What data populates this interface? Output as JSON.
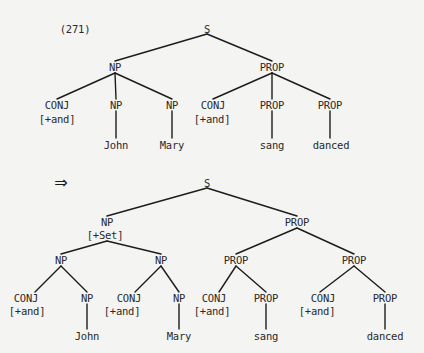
{
  "example_number": "(271)",
  "arrow": "⇒",
  "tree_before": {
    "nodes": [
      {
        "id": "S",
        "label": "S",
        "x": 207,
        "y": 29
      },
      {
        "id": "NP",
        "label": "NP",
        "x": 115,
        "y": 67
      },
      {
        "id": "PROP",
        "label": "PROP",
        "x": 272,
        "y": 67
      },
      {
        "id": "CONJ1",
        "label": "CONJ",
        "x": 57,
        "y": 105
      },
      {
        "id": "CONJ1f",
        "label": "[+and]",
        "x": 57,
        "y": 119
      },
      {
        "id": "NP1",
        "label": "NP",
        "x": 116,
        "y": 105
      },
      {
        "id": "NP2",
        "label": "NP",
        "x": 172,
        "y": 105
      },
      {
        "id": "CONJ2",
        "label": "CONJ",
        "x": 213,
        "y": 105
      },
      {
        "id": "CONJ2f",
        "label": "[+and]",
        "x": 212,
        "y": 119
      },
      {
        "id": "PROP1",
        "label": "PROP",
        "x": 272,
        "y": 105
      },
      {
        "id": "PROP2",
        "label": "PROP",
        "x": 330,
        "y": 105
      },
      {
        "id": "John",
        "label": "John",
        "x": 116,
        "y": 145
      },
      {
        "id": "Mary",
        "label": "Mary",
        "x": 172,
        "y": 145
      },
      {
        "id": "sang",
        "label": "sang",
        "x": 272,
        "y": 145
      },
      {
        "id": "danced",
        "label": "danced",
        "x": 331,
        "y": 145
      }
    ],
    "edges": [
      [
        207,
        34,
        115,
        61
      ],
      [
        207,
        34,
        272,
        61
      ],
      [
        115,
        73,
        57,
        99
      ],
      [
        115,
        73,
        116,
        99
      ],
      [
        115,
        73,
        172,
        99
      ],
      [
        272,
        73,
        213,
        99
      ],
      [
        272,
        73,
        272,
        99
      ],
      [
        272,
        73,
        330,
        99
      ],
      [
        116,
        111,
        116,
        138
      ],
      [
        172,
        111,
        172,
        138
      ],
      [
        272,
        111,
        272,
        138
      ],
      [
        330,
        111,
        330,
        138
      ]
    ]
  },
  "tree_after": {
    "nodes": [
      {
        "id": "S",
        "label": "S",
        "x": 207,
        "y": 183
      },
      {
        "id": "NP",
        "label": "NP",
        "x": 107,
        "y": 222
      },
      {
        "id": "NPf",
        "label": "[+Set]",
        "x": 105,
        "y": 235
      },
      {
        "id": "PROP",
        "label": "PROP",
        "x": 297,
        "y": 222
      },
      {
        "id": "NPa",
        "label": "NP",
        "x": 61,
        "y": 260
      },
      {
        "id": "NPb",
        "label": "NP",
        "x": 161,
        "y": 260
      },
      {
        "id": "PROPa",
        "label": "PROP",
        "x": 236,
        "y": 260
      },
      {
        "id": "PROPb",
        "label": "PROP",
        "x": 354,
        "y": 260
      },
      {
        "id": "CONJa",
        "label": "CONJ",
        "x": 26,
        "y": 298
      },
      {
        "id": "CONJaf",
        "label": "[+and]",
        "x": 27,
        "y": 311
      },
      {
        "id": "NPa1",
        "label": "NP",
        "x": 87,
        "y": 298
      },
      {
        "id": "CONJb",
        "label": "CONJ",
        "x": 129,
        "y": 298
      },
      {
        "id": "CONJbf",
        "label": "[+and]",
        "x": 122,
        "y": 311
      },
      {
        "id": "NPb1",
        "label": "NP",
        "x": 179,
        "y": 298
      },
      {
        "id": "CONJc",
        "label": "CONJ",
        "x": 214,
        "y": 298
      },
      {
        "id": "CONJcf",
        "label": "[+and]",
        "x": 212,
        "y": 311
      },
      {
        "id": "PROPa1",
        "label": "PROP",
        "x": 266,
        "y": 298
      },
      {
        "id": "CONJd",
        "label": "CONJ",
        "x": 323,
        "y": 298
      },
      {
        "id": "CONJdf",
        "label": "[+and]",
        "x": 317,
        "y": 311
      },
      {
        "id": "PROPb1",
        "label": "PROP",
        "x": 385,
        "y": 298
      },
      {
        "id": "John",
        "label": "John",
        "x": 87,
        "y": 336
      },
      {
        "id": "Mary",
        "label": "Mary",
        "x": 179,
        "y": 336
      },
      {
        "id": "sang",
        "label": "sang",
        "x": 266,
        "y": 336
      },
      {
        "id": "danced",
        "label": "danced",
        "x": 385,
        "y": 336
      }
    ],
    "edges": [
      [
        207,
        188,
        107,
        216
      ],
      [
        207,
        188,
        297,
        216
      ],
      [
        107,
        241,
        61,
        254
      ],
      [
        107,
        241,
        161,
        254
      ],
      [
        297,
        228,
        236,
        254
      ],
      [
        297,
        228,
        354,
        254
      ],
      [
        61,
        266,
        35,
        292
      ],
      [
        61,
        266,
        87,
        292
      ],
      [
        161,
        266,
        135,
        292
      ],
      [
        161,
        266,
        179,
        292
      ],
      [
        236,
        266,
        219,
        292
      ],
      [
        236,
        266,
        266,
        292
      ],
      [
        354,
        266,
        320,
        292
      ],
      [
        354,
        266,
        385,
        292
      ],
      [
        87,
        304,
        87,
        329
      ],
      [
        179,
        304,
        179,
        329
      ],
      [
        266,
        304,
        266,
        329
      ],
      [
        385,
        304,
        385,
        329
      ]
    ]
  }
}
